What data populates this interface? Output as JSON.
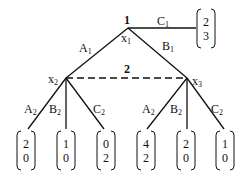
{
  "diagram": {
    "type": "extensive-form game tree",
    "players": {
      "root_player": "1",
      "info_set_player": "2"
    },
    "nodes": {
      "x1": {
        "label": "x",
        "sub": "1",
        "player": "1"
      },
      "x2": {
        "label": "x",
        "sub": "2"
      },
      "x3": {
        "label": "x",
        "sub": "3"
      }
    },
    "edges": {
      "A1": {
        "label": "A",
        "sub": "1"
      },
      "B1": {
        "label": "B",
        "sub": "1"
      },
      "C1": {
        "label": "C",
        "sub": "1"
      },
      "x2_A2": {
        "label": "A",
        "sub": "2"
      },
      "x2_B2": {
        "label": "B",
        "sub": "2"
      },
      "x2_C2": {
        "label": "C",
        "sub": "2"
      },
      "x3_A2": {
        "label": "A",
        "sub": "2"
      },
      "x3_B2": {
        "label": "B",
        "sub": "2"
      },
      "x3_C2": {
        "label": "C",
        "sub": "2"
      }
    },
    "payoffs": {
      "C1": [
        "2",
        "3"
      ],
      "x2_A2": [
        "2",
        "0"
      ],
      "x2_B2": [
        "1",
        "0"
      ],
      "x2_C2": [
        "0",
        "2"
      ],
      "x3_A2": [
        "4",
        "2"
      ],
      "x3_B2": [
        "2",
        "0"
      ],
      "x3_C2": [
        "1",
        "0"
      ]
    },
    "information_set_label": "2",
    "colors": {
      "line": "#111111",
      "background": "#ffffff"
    }
  }
}
